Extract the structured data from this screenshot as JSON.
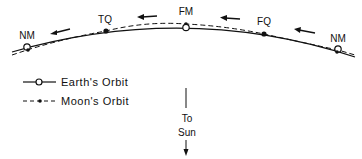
{
  "diagram": {
    "phases": [
      {
        "label": "NM",
        "x": 27,
        "y": 47,
        "marker": "earth-circle"
      },
      {
        "label": "TQ",
        "x": 106,
        "y": 31,
        "marker": "moon-dot"
      },
      {
        "label": "FM",
        "x": 186,
        "y": 27,
        "marker": "earth-circle"
      },
      {
        "label": "FQ",
        "x": 264,
        "y": 34,
        "marker": "moon-dot"
      },
      {
        "label": "NM",
        "x": 338,
        "y": 50,
        "marker": "earth-circle"
      }
    ],
    "legend": {
      "earth": "Earth's Orbit",
      "moon": "Moon's Orbit"
    },
    "sun_direction": {
      "line1": "To",
      "line2": "Sun"
    },
    "colors": {
      "ink": "#111111",
      "background": "#ffffff"
    }
  }
}
